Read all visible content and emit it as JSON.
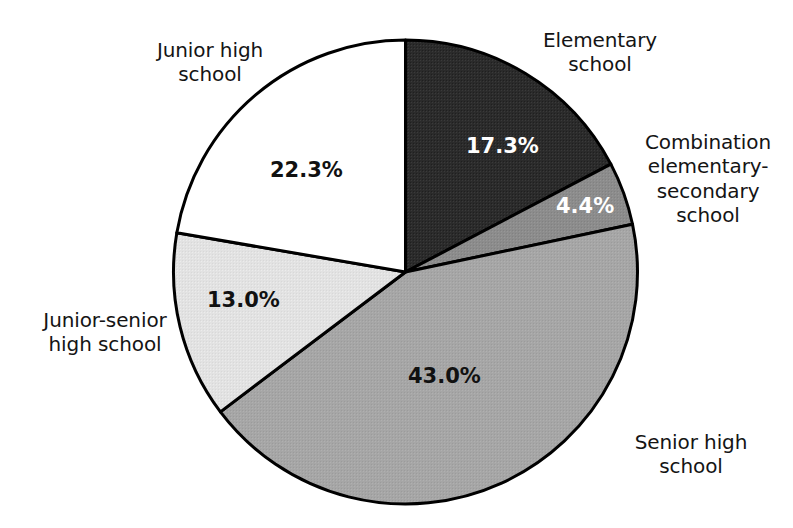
{
  "chart_data": {
    "type": "pie",
    "title": "",
    "subtitle": "",
    "xlabel": "",
    "ylabel": "",
    "legend_position": "none",
    "grid": false,
    "units": "percent",
    "start_angle_deg": 0,
    "direction": "clockwise",
    "categories": [
      "Elementary school",
      "Combination elementary-secondary school",
      "Senior high school",
      "Junior-senior high school",
      "Junior high school"
    ],
    "values": [
      17.3,
      4.4,
      43.0,
      13.0,
      22.3
    ],
    "slices": [
      {
        "name": "elementary",
        "label": "Elementary\nschool",
        "value": 17.3,
        "value_text": "17.3%",
        "color": "#2b2b2b",
        "text_color": "#ffffff",
        "start_deg": 0.0,
        "end_deg": 62.28
      },
      {
        "name": "combination",
        "label": "Combination\nelementary-\nsecondary\nschool",
        "value": 4.4,
        "value_text": "4.4%",
        "color": "#8c8c8c",
        "text_color": "#ffffff",
        "start_deg": 62.28,
        "end_deg": 78.12
      },
      {
        "name": "senior-high",
        "label": "Senior high\nschool",
        "value": 43.0,
        "value_text": "43.0%",
        "color": "#a6a6a6",
        "text_color": "#111111",
        "start_deg": 78.12,
        "end_deg": 232.92
      },
      {
        "name": "junior-senior-high",
        "label": "Junior-senior\nhigh school",
        "value": 13.0,
        "value_text": "13.0%",
        "color": "#e2e2e2",
        "text_color": "#111111",
        "start_deg": 232.92,
        "end_deg": 279.72
      },
      {
        "name": "junior-high",
        "label": "Junior high\nschool",
        "value": 22.3,
        "value_text": "22.3%",
        "color": "#ffffff",
        "text_color": "#111111",
        "start_deg": 279.72,
        "end_deg": 360.0
      }
    ],
    "colors": {
      "background": "#ffffff",
      "outline": "#000000",
      "elementary": "#2b2b2b",
      "combination": "#8c8c8c",
      "senior_high": "#a6a6a6",
      "junior_senior_high": "#e2e2e2",
      "junior_high": "#ffffff",
      "label_text": "#141414"
    }
  },
  "labels": {
    "junior_high": "Junior high\nschool",
    "elementary": "Elementary\nschool",
    "combination": "Combination\nelementary-\nsecondary\nschool",
    "senior_high": "Senior high\nschool",
    "junior_senior_high": "Junior-senior\nhigh school"
  },
  "percents": {
    "elementary": "17.3%",
    "combination": "4.4%",
    "senior_high": "43.0%",
    "junior_senior_high": "13.0%",
    "junior_high": "22.3%"
  }
}
